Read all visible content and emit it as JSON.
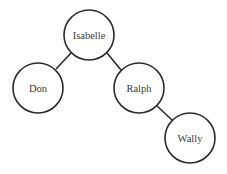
{
  "diagram": {
    "type": "binary-tree",
    "nodes": [
      {
        "id": "isabelle",
        "label": "Isabelle",
        "cx": 89,
        "cy": 35
      },
      {
        "id": "don",
        "label": "Don",
        "cx": 38,
        "cy": 88
      },
      {
        "id": "ralph",
        "label": "Ralph",
        "cx": 139,
        "cy": 88
      },
      {
        "id": "wally",
        "label": "Wally",
        "cx": 190,
        "cy": 138
      }
    ],
    "edges": [
      {
        "from": "Isabelle",
        "to": "Don"
      },
      {
        "from": "Isabelle",
        "to": "Ralph"
      },
      {
        "from": "Ralph",
        "to": "Wally"
      }
    ],
    "colors": {
      "stroke": "#2b2b2b",
      "text": "#3a3a3a",
      "background": "#ffffff"
    }
  }
}
